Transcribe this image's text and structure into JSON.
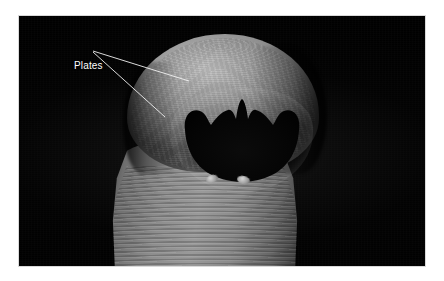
{
  "figure": {
    "kind": "scanning-electron-micrograph",
    "background_color": "#000000",
    "page_color": "#ffffff",
    "specimen_color": "#8e8e8e"
  },
  "annotations": {
    "label_color": "#ffffff",
    "leader_color": "#f2f2f2",
    "items": [
      {
        "id": "plates",
        "text": "Plates",
        "label_x": 74,
        "label_y": 60,
        "leaders": [
          {
            "x1": 112,
            "y1": 67,
            "x2": 208,
            "y2": 97
          },
          {
            "x1": 112,
            "y1": 68,
            "x2": 184,
            "y2": 133
          }
        ]
      }
    ]
  },
  "photo": {
    "x": 19,
    "y": 16,
    "width": 406,
    "height": 250
  }
}
